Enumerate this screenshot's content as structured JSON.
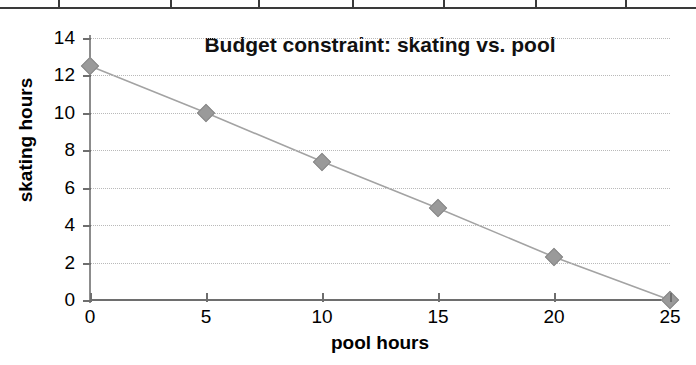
{
  "table_strip": {
    "divider_positions": [
      58,
      170,
      258,
      352,
      443,
      535,
      625
    ]
  },
  "chart_data": {
    "type": "line",
    "title": "Budget constraint: skating vs. pool",
    "xlabel": "pool hours",
    "ylabel": "skating hours",
    "x": [
      0,
      5,
      10,
      15,
      20,
      25
    ],
    "values": [
      12.5,
      10.0,
      7.4,
      4.9,
      2.3,
      0.0
    ],
    "series": [
      {
        "name": "Budget constraint",
        "values": [
          12.5,
          10.0,
          7.4,
          4.9,
          2.3,
          0.0
        ]
      }
    ],
    "xlim": [
      0,
      25
    ],
    "ylim": [
      0,
      14
    ],
    "xticks": [
      0,
      5,
      10,
      15,
      20,
      25
    ],
    "yticks": [
      0,
      2,
      4,
      6,
      8,
      10,
      12,
      14
    ],
    "xtick_labels": [
      "0",
      "5",
      "10",
      "15",
      "20",
      "25"
    ],
    "ytick_labels": [
      "0",
      "2",
      "4",
      "6",
      "8",
      "10",
      "12",
      "14"
    ],
    "grid": "horizontal-dotted",
    "legend": "none",
    "marker": "diamond",
    "line_color": "#a3a3a3",
    "marker_color": "#9a9a9a",
    "grid_color": "#b9b9b9",
    "axis_color": "#6e6e6e",
    "background": "#ffffff"
  }
}
